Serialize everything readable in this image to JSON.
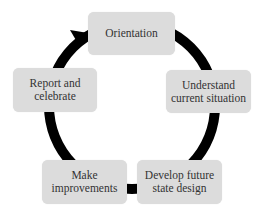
{
  "diagram": {
    "type": "cycle",
    "direction": "clockwise",
    "colors": {
      "box_fill": "#dcdcdc",
      "ring": "#000000",
      "text": "#333333",
      "background": "#ffffff"
    },
    "steps": [
      {
        "id": "orientation",
        "lines": [
          "Orientation"
        ]
      },
      {
        "id": "understand",
        "lines": [
          "Understand",
          "current situation"
        ]
      },
      {
        "id": "develop",
        "lines": [
          "Develop future",
          "state design"
        ]
      },
      {
        "id": "make",
        "lines": [
          "Make",
          "improvements"
        ]
      },
      {
        "id": "report",
        "lines": [
          "Report and",
          "celebrate"
        ]
      }
    ],
    "arrow": {
      "from": "report",
      "to": "orientation",
      "icon": "arrowhead-icon"
    }
  }
}
